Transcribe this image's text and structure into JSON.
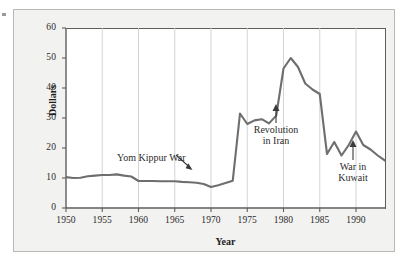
{
  "figure": {
    "ylabel": "Dollars",
    "xlabel": "Year"
  },
  "chart_data": {
    "type": "line",
    "title": "",
    "xlabel": "Year",
    "ylabel": "Dollars",
    "xlim": [
      1950,
      1994
    ],
    "ylim": [
      0,
      60
    ],
    "grid": "vertical gridlines at x ticks",
    "legend": "none",
    "xticks": [
      "1950",
      "1955",
      "1960",
      "1965",
      "1970",
      "1975",
      "1980",
      "1985",
      "1990"
    ],
    "xtick_values": [
      1950,
      1955,
      1960,
      1965,
      1970,
      1975,
      1980,
      1985,
      1990
    ],
    "yticks": [
      "0",
      "10",
      "20",
      "30",
      "40",
      "50",
      "60"
    ],
    "ytick_values": [
      0,
      10,
      20,
      30,
      40,
      50,
      60
    ],
    "series": [
      {
        "name": "Dollars",
        "color": "#6e6e6e",
        "x": [
          1950,
          1951,
          1952,
          1953,
          1954,
          1955,
          1956,
          1957,
          1958,
          1959,
          1960,
          1961,
          1962,
          1963,
          1964,
          1965,
          1966,
          1967,
          1968,
          1969,
          1970,
          1971,
          1972,
          1973,
          1974,
          1975,
          1976,
          1977,
          1978,
          1979,
          1980,
          1981,
          1982,
          1983,
          1984,
          1985,
          1986,
          1987,
          1988,
          1989,
          1990,
          1991,
          1992,
          1993,
          1994
        ],
        "values": [
          10.3,
          10.0,
          10.1,
          10.6,
          10.8,
          11.0,
          11.0,
          11.2,
          10.8,
          10.5,
          9.0,
          9.0,
          9.0,
          8.9,
          8.9,
          8.9,
          8.7,
          8.6,
          8.4,
          8.0,
          7.0,
          7.6,
          8.3,
          9.1,
          31.5,
          28.0,
          29.2,
          29.6,
          28.2,
          30.8,
          46.5,
          50.0,
          47.0,
          41.5,
          39.5,
          38.0,
          18.0,
          22.0,
          17.5,
          21.0,
          25.5,
          21.0,
          19.5,
          17.5,
          15.8
        ]
      }
    ],
    "annotations": [
      {
        "name": "yom-kippur-war",
        "text": "Yom Kippur War",
        "points_to_year": 1973,
        "arrow": "down-right"
      },
      {
        "name": "revolution-in-iran",
        "text": "Revolution\nin Iran",
        "line1": "Revolution",
        "line2": "in Iran",
        "points_to_year": 1980,
        "arrow": "up"
      },
      {
        "name": "war-in-kuwait",
        "text": "War in\nKuwait",
        "line1": "War in",
        "line2": "Kuwait",
        "points_to_year": 1990,
        "arrow": "up"
      }
    ]
  }
}
